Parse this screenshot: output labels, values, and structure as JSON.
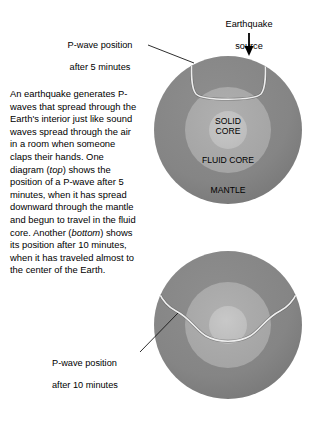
{
  "figure": {
    "background_color": "#ffffff",
    "width": 316,
    "height": 428
  },
  "annotations": {
    "earthquake_source": {
      "line1": "Earthquake",
      "line2": "source",
      "icon": "down-arrow-icon"
    },
    "pwave_5min": {
      "line1": "P-wave position",
      "line2": "after 5 minutes",
      "icon": "leader-line-icon"
    },
    "pwave_10min": {
      "line1": "P-wave position",
      "line2": "after 10 minutes",
      "icon": "leader-line-icon"
    }
  },
  "body_text": {
    "part1": "An earthquake generates P-waves that spread through the Earth's interior just like sound waves spread through the air in a room when someone claps their hands. One diagram (",
    "em1": "top",
    "part2": ") shows the position of a P-wave after 5 minutes, when it has spread downward through the mantle and begun to travel in the fluid core. Another (",
    "em2": "bottom",
    "part3": ") shows its position after 10 minutes, when it has traveled almost to the center of the Earth."
  },
  "diagrams": {
    "top": {
      "name": "earth-cross-section-5min",
      "caption_ref": "top",
      "layers": [
        {
          "name": "mantle",
          "label": "MANTLE",
          "color": "#868686",
          "radius": 74
        },
        {
          "name": "fluid-core",
          "label": "FLUID CORE",
          "color": "#a9a9a9",
          "radius": 43
        },
        {
          "name": "solid-core",
          "label": "SOLID CORE",
          "color": "#c2c2c2",
          "radius": 19
        }
      ],
      "wavefront": "shallow-pocket-near-surface",
      "elapsed_minutes": 5
    },
    "bottom": {
      "name": "earth-cross-section-10min",
      "caption_ref": "bottom",
      "layers": [
        {
          "name": "mantle",
          "label": "",
          "color": "#868686",
          "radius": 74
        },
        {
          "name": "fluid-core",
          "label": "",
          "color": "#a9a9a9",
          "radius": 43
        },
        {
          "name": "solid-core",
          "label": "",
          "color": "#c2c2c2",
          "radius": 19
        }
      ],
      "wavefront": "deep-arc-with-central-dip",
      "elapsed_minutes": 10
    }
  },
  "colors": {
    "mantle": "#868686",
    "fluid_core": "#a9a9a9",
    "solid_core": "#c2c2c2",
    "wavefront_line": "#e8e8e8",
    "wavefront_shadow": "#4a4a4a",
    "text": "#000000",
    "leader_line": "#1a1a1a",
    "background": "#ffffff"
  }
}
